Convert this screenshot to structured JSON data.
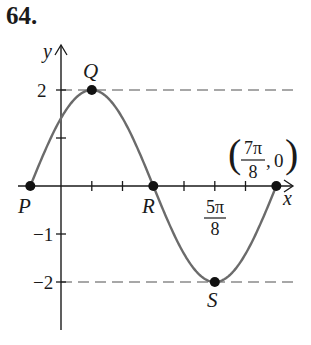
{
  "problem": {
    "number": "64."
  },
  "chart_data": {
    "type": "line",
    "title": "",
    "function": "y = 2 sin(2(x + π/8))",
    "xlabel": "x",
    "ylabel": "y",
    "x_tick_step": "π/8",
    "y_ticks": [
      {
        "value": 2,
        "label": "2"
      },
      {
        "value": 1,
        "label": ""
      },
      {
        "value": -1,
        "label": "−1"
      },
      {
        "value": -2,
        "label": "−2"
      }
    ],
    "x_tick_labels": [
      {
        "value": "5π/8",
        "num": "5π",
        "den": "8"
      }
    ],
    "points": [
      {
        "label": "P",
        "x": "−π/8",
        "y": 0
      },
      {
        "label": "Q",
        "x": "π/8",
        "y": 2
      },
      {
        "label": "R",
        "x": "3π/8",
        "y": 0
      },
      {
        "label": "S",
        "x": "5π/8",
        "y": -2
      },
      {
        "label": "",
        "x": "7π/8",
        "y": 0
      }
    ],
    "annotation": {
      "text": "(7π/8, 0)",
      "num": "7π",
      "den": "8",
      "y": "0"
    },
    "reference_lines": [
      {
        "type": "dashed",
        "y": 2
      },
      {
        "type": "dashed",
        "y": -2
      }
    ],
    "grid": false,
    "curve_color": "#6b6b6b",
    "axis_color": "#1a1a1a"
  }
}
